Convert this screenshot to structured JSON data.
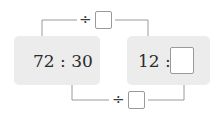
{
  "diagram": {
    "left_ratio": {
      "first": "72",
      "separator": ":",
      "second": "30",
      "text": "72 : 30"
    },
    "right_ratio": {
      "first": "12",
      "separator": ":",
      "second": "",
      "text": "12 :"
    },
    "top_operation": {
      "operator": "÷",
      "value": ""
    },
    "bottom_operation": {
      "operator": "÷",
      "value": ""
    },
    "colors": {
      "panel": "#ececec",
      "line": "#9a9a9a",
      "text": "#2a2a2a"
    }
  }
}
